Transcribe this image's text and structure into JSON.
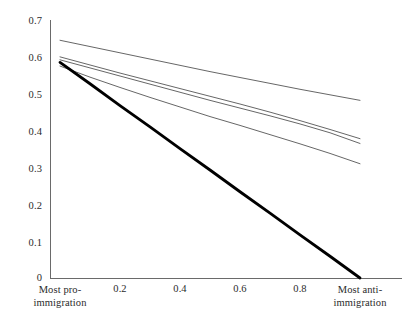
{
  "chart_data": {
    "type": "line",
    "title": "",
    "subtitle": "",
    "xlabel": "",
    "ylabel": "",
    "xlim": [
      0,
      1
    ],
    "ylim": [
      0,
      0.7
    ],
    "grid": false,
    "legend_position": "none",
    "y_ticks": [
      "0.7",
      "0.6",
      "0.5",
      "0.4",
      "0.3",
      "0.2",
      "0.1",
      "0"
    ],
    "y_tick_values": [
      0.7,
      0.6,
      0.5,
      0.4,
      0.3,
      0.2,
      0.1,
      0
    ],
    "x_ticks": [
      "Most pro-immigration",
      "0.2",
      "0.4",
      "0.6",
      "0.8",
      "Most anti-immigration"
    ],
    "x_tick_values": [
      0,
      0.2,
      0.4,
      0.6,
      0.8,
      1
    ],
    "x_axis_left_label_line1": "Most pro-",
    "x_axis_left_label_line2": "immigration",
    "x_axis_right_label_line1": "Most anti-",
    "x_axis_right_label_line2": "immigration",
    "series": [
      {
        "name": "line-1-top",
        "style": "thin",
        "color": "#555555",
        "width": 0.9,
        "x": [
          0,
          0.1,
          0.2,
          0.3,
          0.4,
          0.5,
          0.6,
          0.7,
          0.8,
          0.9,
          1.0
        ],
        "values": [
          0.645,
          0.628,
          0.611,
          0.594,
          0.577,
          0.56,
          0.544,
          0.528,
          0.512,
          0.497,
          0.482
        ]
      },
      {
        "name": "line-2",
        "style": "thin",
        "color": "#555555",
        "width": 0.9,
        "x": [
          0,
          0.1,
          0.2,
          0.3,
          0.4,
          0.5,
          0.6,
          0.7,
          0.8,
          0.9,
          1.0
        ],
        "values": [
          0.6,
          0.578,
          0.556,
          0.535,
          0.514,
          0.493,
          0.472,
          0.45,
          0.427,
          0.403,
          0.378
        ]
      },
      {
        "name": "line-3",
        "style": "thin",
        "color": "#555555",
        "width": 0.9,
        "x": [
          0,
          0.1,
          0.2,
          0.3,
          0.4,
          0.5,
          0.6,
          0.7,
          0.8,
          0.9,
          1.0
        ],
        "values": [
          0.592,
          0.57,
          0.548,
          0.526,
          0.504,
          0.482,
          0.461,
          0.44,
          0.418,
          0.394,
          0.365
        ]
      },
      {
        "name": "line-4",
        "style": "thin",
        "color": "#555555",
        "width": 0.9,
        "x": [
          0,
          0.1,
          0.2,
          0.3,
          0.4,
          0.5,
          0.6,
          0.7,
          0.8,
          0.9,
          1.0
        ],
        "values": [
          0.575,
          0.545,
          0.517,
          0.49,
          0.464,
          0.438,
          0.414,
          0.389,
          0.364,
          0.338,
          0.31
        ]
      },
      {
        "name": "line-5-bold",
        "style": "bold",
        "color": "#000000",
        "width": 2.8,
        "x": [
          0,
          0.1,
          0.2,
          0.3,
          0.4,
          0.5,
          0.6,
          0.7,
          0.8,
          0.9,
          1.0
        ],
        "values": [
          0.585,
          0.527,
          0.468,
          0.41,
          0.351,
          0.293,
          0.234,
          0.176,
          0.117,
          0.059,
          0.0
        ]
      }
    ]
  }
}
